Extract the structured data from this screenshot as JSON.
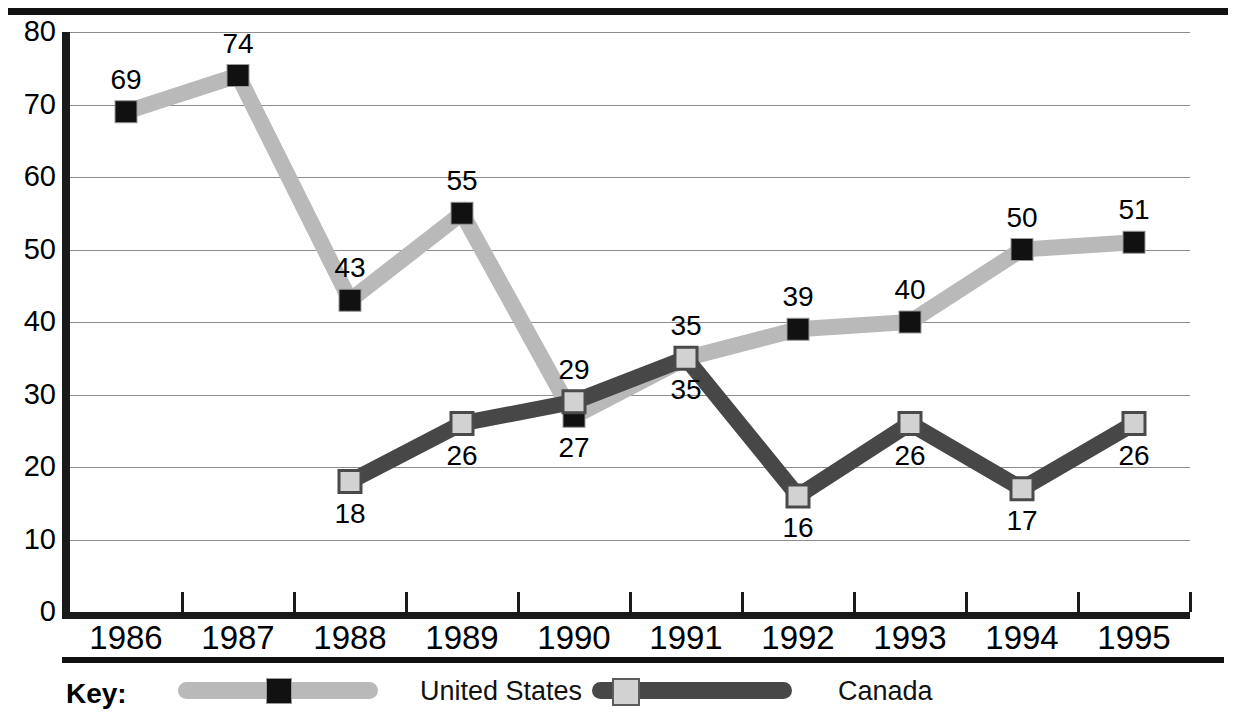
{
  "chart_data": {
    "type": "line",
    "title": "",
    "xlabel": "",
    "ylabel": "",
    "categories": [
      "1986",
      "1987",
      "1988",
      "1989",
      "1990",
      "1991",
      "1992",
      "1993",
      "1994",
      "1995"
    ],
    "ylim": [
      0,
      80
    ],
    "ytick_labels": [
      "0",
      "10",
      "20",
      "30",
      "40",
      "50",
      "60",
      "70",
      "80"
    ],
    "ytick_values": [
      0,
      10,
      20,
      30,
      40,
      50,
      60,
      70,
      80
    ],
    "grid": true,
    "legend_position": "bottom",
    "series": [
      {
        "name": "United States",
        "color": "#b9b9b9",
        "marker_color": "#111111",
        "x": [
          "1986",
          "1987",
          "1988",
          "1989",
          "1990",
          "1991",
          "1992",
          "1993",
          "1994",
          "1995"
        ],
        "values": [
          69,
          74,
          43,
          55,
          27,
          35,
          39,
          40,
          50,
          51
        ],
        "point_labels": [
          "69",
          "74",
          "43",
          "55",
          "27",
          "35",
          "39",
          "40",
          "50",
          "51"
        ]
      },
      {
        "name": "Canada",
        "color": "#474747",
        "marker_color": "#d2d2d2",
        "x": [
          "1988",
          "1989",
          "1990",
          "1991",
          "1992",
          "1993",
          "1994",
          "1995"
        ],
        "values": [
          18,
          26,
          29,
          35,
          16,
          26,
          17,
          26
        ],
        "point_labels": [
          "18",
          "26",
          "29",
          "35",
          "16",
          "26",
          "17",
          "26"
        ]
      }
    ]
  },
  "legend": {
    "key_label": "Key:",
    "entries": [
      {
        "label": "United States",
        "series": "United States"
      },
      {
        "label": "Canada",
        "series": "Canada"
      }
    ]
  }
}
